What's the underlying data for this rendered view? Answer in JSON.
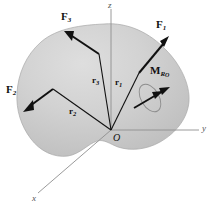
{
  "figure": {
    "caption_present": false,
    "background_color": "#ffffff",
    "body_fill_color": "#c8c8c8",
    "body_fill_color_light": "#dcdcdc",
    "body_outline_color": "#9a9a9a",
    "vector_color": "#111111",
    "axis_color": "#8a8a8a"
  },
  "axes": [
    {
      "name": "z-axis",
      "label": "z",
      "direction": "up"
    },
    {
      "name": "y-axis",
      "label": "y",
      "direction": "right"
    },
    {
      "name": "x-axis",
      "label": "x",
      "direction": "lower-left"
    }
  ],
  "origin": {
    "label": "O",
    "x": 111,
    "y": 130
  },
  "force_vectors": [
    {
      "name": "force-1",
      "label": "F",
      "subscript": "1",
      "label_x": 158,
      "label_y": 25,
      "tail_x": 140,
      "tail_y": 72,
      "head_x": 167,
      "head_y": 40
    },
    {
      "name": "force-2",
      "label": "F",
      "subscript": "2",
      "label_x": 9,
      "label_y": 89,
      "tail_x": 52,
      "tail_y": 89,
      "head_x": 24,
      "head_y": 110
    },
    {
      "name": "force-3",
      "label": "F",
      "subscript": "3",
      "label_x": 63,
      "label_y": 17,
      "tail_x": 98,
      "tail_y": 52,
      "head_x": 67,
      "head_y": 33
    }
  ],
  "position_vectors": [
    {
      "name": "position-vector-1",
      "label": "r",
      "subscript": "1",
      "label_x": 116,
      "label_y": 83,
      "from_x": 111,
      "from_y": 130,
      "to_x": 140,
      "to_y": 72
    },
    {
      "name": "position-vector-2",
      "label": "r",
      "subscript": "2",
      "label_x": 72,
      "label_y": 112,
      "from_x": 111,
      "from_y": 130,
      "to_x": 52,
      "to_y": 89
    },
    {
      "name": "position-vector-3",
      "label": "r",
      "subscript": "3",
      "label_x": 94,
      "label_y": 81,
      "from_x": 111,
      "from_y": 130,
      "to_x": 98,
      "to_y": 52
    }
  ],
  "moment_vector": {
    "name": "resultant-moment-vector",
    "label": "M",
    "subscript_r": "R",
    "subscript_o": "O",
    "label_x": 152,
    "label_y": 71,
    "tail_x": 135,
    "tail_y": 107,
    "head_x": 168,
    "head_y": 88,
    "double_arrowhead": true,
    "rotation_sense_ellipse": true
  }
}
